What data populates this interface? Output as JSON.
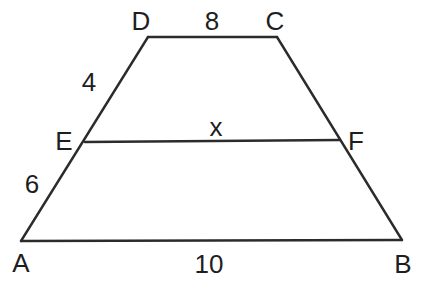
{
  "figure": {
    "name": "trapezoid-midsegment-diagram",
    "background": "#ffffff",
    "stroke_color": "#2b2b2b",
    "text_color": "#1e1e1e",
    "stroke_width": 2.4,
    "font_size": 26,
    "vertices": {
      "A": {
        "x": 21,
        "y": 241
      },
      "B": {
        "x": 402,
        "y": 240
      },
      "C": {
        "x": 277,
        "y": 37
      },
      "D": {
        "x": 148,
        "y": 37
      },
      "E": {
        "x": 85,
        "y": 142
      },
      "F": {
        "x": 340,
        "y": 140
      }
    },
    "segments": [
      {
        "id": "edge-DC",
        "x1": 148,
        "y1": 37,
        "x2": 277,
        "y2": 37
      },
      {
        "id": "edge-DA",
        "x1": 148,
        "y1": 37,
        "x2": 21,
        "y2": 241
      },
      {
        "id": "edge-CB",
        "x1": 277,
        "y1": 37,
        "x2": 402,
        "y2": 240
      },
      {
        "id": "edge-AB",
        "x1": 21,
        "y1": 241,
        "x2": 402,
        "y2": 240
      },
      {
        "id": "midsegment-EF",
        "x1": 85,
        "y1": 142,
        "x2": 340,
        "y2": 140
      }
    ],
    "labels": [
      {
        "id": "vertex-label-D",
        "text": "D",
        "x": 141,
        "y": 30
      },
      {
        "id": "side-label-DC",
        "text": "8",
        "x": 212,
        "y": 30
      },
      {
        "id": "vertex-label-C",
        "text": "C",
        "x": 275,
        "y": 30
      },
      {
        "id": "side-label-DE",
        "text": "4",
        "x": 89,
        "y": 91
      },
      {
        "id": "vertex-label-E",
        "text": "E",
        "x": 64,
        "y": 150
      },
      {
        "id": "side-label-EF",
        "text": "x",
        "x": 216,
        "y": 136
      },
      {
        "id": "vertex-label-F",
        "text": "F",
        "x": 356,
        "y": 150
      },
      {
        "id": "side-label-EA",
        "text": "6",
        "x": 32,
        "y": 193
      },
      {
        "id": "vertex-label-A",
        "text": "A",
        "x": 21,
        "y": 272
      },
      {
        "id": "side-label-AB",
        "text": "10",
        "x": 209,
        "y": 273
      },
      {
        "id": "vertex-label-B",
        "text": "B",
        "x": 403,
        "y": 273
      }
    ],
    "measurements": {
      "DC": "8",
      "DE": "4",
      "EF": "x",
      "EA": "6",
      "AB": "10"
    }
  }
}
